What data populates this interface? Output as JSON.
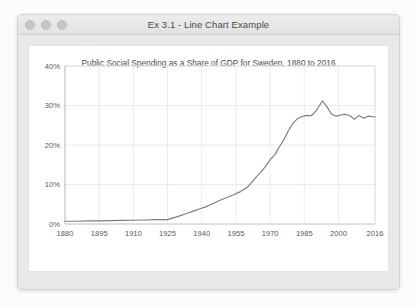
{
  "window": {
    "title": "Ex 3.1 - Line Chart Example",
    "traffic_lights": [
      {
        "name": "close",
        "color": "#c6c6c6"
      },
      {
        "name": "minimize",
        "color": "#c6c6c6"
      },
      {
        "name": "zoom",
        "color": "#c6c6c6"
      }
    ]
  },
  "chart_data": {
    "type": "line",
    "title": "Public Social Spending as a Share of GDP for Sweden, 1880 to 2016",
    "xlabel": "",
    "ylabel": "",
    "grid": true,
    "legend": false,
    "line_color": "#7d7d7d",
    "xlim": [
      1880,
      2016
    ],
    "ylim": [
      0,
      40
    ],
    "ytick_labels": [
      "0%",
      "10%",
      "20%",
      "30%",
      "40%"
    ],
    "ytick_values": [
      0,
      10,
      20,
      30,
      40
    ],
    "xtick_labels": [
      "1880",
      "1895",
      "1910",
      "1925",
      "1940",
      "1955",
      "1970",
      "1985",
      "2000",
      "2016"
    ],
    "xtick_values": [
      1880,
      1895,
      1910,
      1925,
      1940,
      1955,
      1970,
      1985,
      2000,
      2016
    ],
    "series": [
      {
        "name": "Sweden",
        "x": [
          1880,
          1885,
          1890,
          1895,
          1900,
          1905,
          1910,
          1915,
          1920,
          1925,
          1930,
          1933,
          1936,
          1939,
          1942,
          1945,
          1948,
          1951,
          1954,
          1957,
          1960,
          1962,
          1964,
          1966,
          1968,
          1970,
          1972,
          1974,
          1976,
          1978,
          1980,
          1982,
          1984,
          1986,
          1988,
          1990,
          1992,
          1993,
          1995,
          1997,
          1999,
          2001,
          2003,
          2005,
          2007,
          2009,
          2011,
          2013,
          2016
        ],
        "values": [
          0.7,
          0.7,
          0.8,
          0.8,
          0.85,
          0.9,
          0.95,
          1.0,
          1.1,
          1.1,
          2.0,
          2.6,
          3.2,
          3.8,
          4.4,
          5.2,
          6.0,
          6.7,
          7.4,
          8.2,
          9.3,
          10.6,
          12.0,
          13.2,
          14.6,
          16.3,
          17.5,
          19.5,
          21.3,
          23.6,
          25.5,
          26.7,
          27.2,
          27.5,
          27.4,
          28.5,
          30.3,
          31.2,
          29.6,
          27.8,
          27.3,
          27.6,
          27.8,
          27.4,
          26.5,
          27.5,
          26.8,
          27.3,
          27.1
        ]
      }
    ]
  }
}
